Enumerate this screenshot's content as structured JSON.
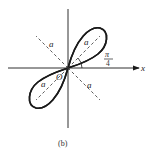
{
  "figure": {
    "caption": "(b)",
    "curve": "four-leaf rose",
    "axis_label_x": "x",
    "origin_label": "O",
    "petal_length_label": "a",
    "angle_label_num": "π",
    "angle_label_den": "4",
    "colors": {
      "curve": "#1a1a1a",
      "axis": "#1a1a1a",
      "dashed": "#333333",
      "background": "#ffffff"
    }
  }
}
